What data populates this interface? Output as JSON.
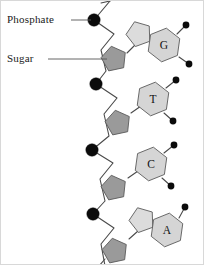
{
  "figure": {
    "width": 204,
    "height": 265,
    "background_color": "#ffffff",
    "border_color": "#d8d8d8"
  },
  "colors": {
    "phosphate_fill": "#0b0b0b",
    "sugar_fill": "#9a9a9a",
    "base_fill": "#d5d5d5",
    "base_five_ring_fill": "#dcdcdc",
    "outline": "#5a5a5a",
    "bond": "#4a4a4a",
    "leader": "#555555",
    "text": "#1a1a1a"
  },
  "annotations": [
    {
      "id": "phosphate",
      "label": "Phosphate",
      "icon": "black-filled-circle",
      "text_x": 6,
      "text_y": 22,
      "leader_from_x": 70,
      "leader_from_y": 19,
      "leader_to_x": 90,
      "leader_to_y": 19
    },
    {
      "id": "sugar",
      "label": "Sugar",
      "icon": "gray-pentagon",
      "text_x": 6,
      "text_y": 61,
      "leader_from_x": 47,
      "leader_from_y": 58,
      "leader_to_x": 106,
      "leader_to_y": 58
    }
  ],
  "backbone": {
    "description": "Alternating phosphate groups and deoxyribose sugars forming the sugar-phosphate backbone",
    "phosphates": [
      {
        "index": 1,
        "cx": 93,
        "cy": 19,
        "r": 6.2
      },
      {
        "index": 2,
        "cx": 95,
        "cy": 83,
        "r": 6.2
      },
      {
        "index": 3,
        "cx": 91,
        "cy": 149,
        "r": 6.2
      },
      {
        "index": 4,
        "cx": 92,
        "cy": 213,
        "r": 6.2
      }
    ],
    "sugars": [
      {
        "index": 1,
        "cx": 113,
        "cy": 58,
        "r": 13,
        "rotation": -12
      },
      {
        "index": 2,
        "cx": 117,
        "cy": 122,
        "r": 13,
        "rotation": -12
      },
      {
        "index": 3,
        "cx": 113,
        "cy": 187,
        "r": 13,
        "rotation": -12
      },
      {
        "index": 4,
        "cx": 114,
        "cy": 250,
        "r": 13,
        "rotation": -12
      }
    ],
    "backbone_path": "M 109 0 L 93 19 L 113 33 L 100 49 L 105 70 L 95 83 L 116 97 L 103 113 L 108 135 L 91 149 L 112 162 L 99 178 L 104 200 L 92 213 L 113 227 L 100 243 L 104 265",
    "top_stub_path": "M 100 2 L 109 0",
    "bottom_stub_path": "M 104 258 L 98 265"
  },
  "bases": [
    {
      "id": "guanine",
      "letter": "G",
      "type": "purine",
      "ring_count": 2,
      "label_x": 163,
      "label_y": 44,
      "hex_cx": 163,
      "hex_cy": 44,
      "hex_r": 17,
      "five_cx": 138,
      "five_cy": 33,
      "five_r": 13,
      "glycosidic_bond": "M 126 52 L 134 44",
      "substituents": [
        {
          "cx": 185,
          "cy": 24,
          "r": 3.4,
          "bond": "M 176 33 L 185 24"
        },
        {
          "cx": 188,
          "cy": 63,
          "r": 3.4,
          "bond": "M 178 56 L 188 63"
        }
      ]
    },
    {
      "id": "thymine",
      "letter": "T",
      "type": "pyrimidine",
      "ring_count": 1,
      "label_x": 152,
      "label_y": 98,
      "hex_cx": 152,
      "hex_cy": 98,
      "hex_r": 17,
      "glycosidic_bond": "M 130 112 L 140 105",
      "substituents": [
        {
          "cx": 175,
          "cy": 79,
          "r": 3.4,
          "bond": "M 165 87 L 175 79"
        },
        {
          "cx": 172,
          "cy": 120,
          "r": 3.4,
          "bond": "M 163 112 L 172 120"
        }
      ]
    },
    {
      "id": "cytosine",
      "letter": "C",
      "type": "pyrimidine",
      "ring_count": 1,
      "label_x": 150,
      "label_y": 163,
      "hex_cx": 150,
      "hex_cy": 163,
      "hex_r": 17,
      "glycosidic_bond": "M 127 177 L 137 170",
      "substituents": [
        {
          "cx": 173,
          "cy": 144,
          "r": 3.4,
          "bond": "M 163 152 L 173 144"
        },
        {
          "cx": 170,
          "cy": 185,
          "r": 3.4,
          "bond": "M 161 177 L 170 185"
        }
      ]
    },
    {
      "id": "adenine",
      "letter": "A",
      "type": "purine",
      "ring_count": 2,
      "label_x": 166,
      "label_y": 229,
      "hex_cx": 166,
      "hex_cy": 229,
      "hex_r": 17,
      "five_cx": 141,
      "five_cy": 219,
      "five_r": 13,
      "glycosidic_bond": "M 128 238 L 137 230",
      "substituents": [
        {
          "cx": 184,
          "cy": 206,
          "r": 3.4,
          "bond": "M 178 217 L 184 206"
        }
      ]
    }
  ]
}
